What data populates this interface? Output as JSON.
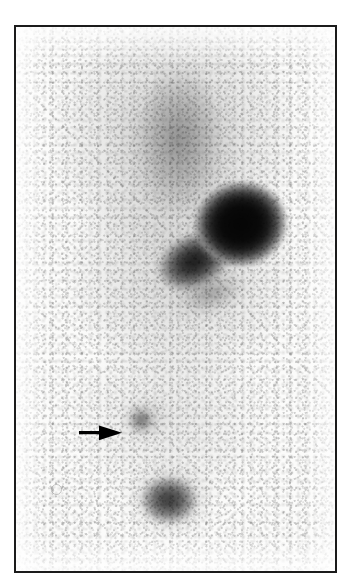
{
  "image": {
    "kind": "nuclear-medicine-scintigram",
    "orientation": "anterior whole-body planar view",
    "modality_label": "",
    "width_px": 351,
    "height_px": 588
  },
  "frame": {
    "left_px": 14,
    "top_px": 25,
    "width_px": 323,
    "height_px": 548,
    "border_color": "#1b1b1b",
    "background_color": "#f2f2f0"
  },
  "palette": {
    "film_white": "#fbfbfa",
    "paper_white": "#ffffff",
    "mid_gray": "#8d8d8d",
    "dark_gray": "#3b3b3b",
    "hot_black": "#050505",
    "border_black": "#1b1b1b",
    "arrow_black": "#000000"
  },
  "annotations": {
    "arrow": {
      "icon": "arrow-right-icon",
      "label": "",
      "color": "#000000",
      "tip_x_px": 118,
      "tip_y_px": 431,
      "tail_x_px": 78,
      "tail_y_px": 431,
      "points_to": "focal-uptake-lesion"
    },
    "text_labels": []
  },
  "features": [
    {
      "name": "upper-diffuse-wedge",
      "description": "diffuse wedge-shaped low-grade uptake in upper field",
      "intensity": "low",
      "center_pct": {
        "x": 51,
        "y": 19
      }
    },
    {
      "name": "main-hot-spot",
      "description": "intense focal tracer accumulation, upper right field",
      "intensity": "very high",
      "center_pct": {
        "x": 70,
        "y": 36
      }
    },
    {
      "name": "hot-spot-tail",
      "description": "elongated moderate uptake trailing inferolaterally from the hot spot",
      "intensity": "moderate-high",
      "center_pct": {
        "x": 55,
        "y": 44
      }
    },
    {
      "name": "focal-uptake-lesion",
      "description": "small faint focus of uptake marked by the arrow",
      "intensity": "low-moderate",
      "center_pct": {
        "x": 40,
        "y": 72
      }
    },
    {
      "name": "lower-rounded-focus",
      "description": "rounded moderate uptake in lower midline field",
      "intensity": "moderate",
      "center_pct": {
        "x": 48,
        "y": 87
      }
    },
    {
      "name": "print-artifact",
      "description": "small faint ring artifact on the film",
      "intensity": "negligible",
      "center_pct": {
        "x": 11,
        "y": 84
      }
    }
  ]
}
